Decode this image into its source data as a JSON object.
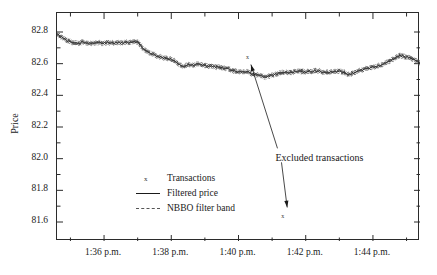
{
  "chart_data": {
    "type": "line",
    "title": "",
    "xlabel": "",
    "ylabel": "Price",
    "grid": false,
    "legend_position": "inside-lower-left",
    "ylim": [
      81.48,
      82.92
    ],
    "yticks": [
      "82.8",
      "82.6",
      "82.4",
      "82.2",
      "82.0",
      "81.8",
      "81.6"
    ],
    "ytick_values": [
      82.8,
      82.6,
      82.4,
      82.2,
      82.0,
      81.8,
      81.6
    ],
    "xticks": [
      "1:36 p.m.",
      "1:38 p.m.",
      "1:40 p.m.",
      "1:42 p.m.",
      "1:44 p.m."
    ],
    "xtick_minutes": [
      96,
      98,
      100,
      102,
      104
    ],
    "xlim_minutes": [
      94.6,
      105.4
    ],
    "series": [
      {
        "name": "Filtered price",
        "style": "solid",
        "color": "#333333",
        "x": [
          94.6,
          94.75,
          94.9,
          95.05,
          95.2,
          95.35,
          95.5,
          95.65,
          95.8,
          95.95,
          96.1,
          96.25,
          96.4,
          96.55,
          96.7,
          96.85,
          97.0,
          97.15,
          97.3,
          97.45,
          97.6,
          97.75,
          97.9,
          98.05,
          98.2,
          98.35,
          98.5,
          98.65,
          98.8,
          98.95,
          99.1,
          99.25,
          99.4,
          99.55,
          99.7,
          99.85,
          100.0,
          100.15,
          100.3,
          100.45,
          100.6,
          100.75,
          100.9,
          101.05,
          101.2,
          101.35,
          101.5,
          101.65,
          101.8,
          101.95,
          102.1,
          102.25,
          102.4,
          102.55,
          102.7,
          102.85,
          103.0,
          103.15,
          103.3,
          103.45,
          103.6,
          103.75,
          103.9,
          104.05,
          104.2,
          104.35,
          104.5,
          104.65,
          104.8,
          104.95,
          105.1,
          105.25,
          105.4
        ],
        "y": [
          82.785,
          82.765,
          82.745,
          82.735,
          82.73,
          82.735,
          82.73,
          82.728,
          82.732,
          82.73,
          82.734,
          82.73,
          82.735,
          82.733,
          82.736,
          82.734,
          82.738,
          82.7,
          82.675,
          82.66,
          82.645,
          82.64,
          82.632,
          82.625,
          82.6,
          82.585,
          82.595,
          82.59,
          82.6,
          82.592,
          82.585,
          82.58,
          82.578,
          82.572,
          82.565,
          82.555,
          82.548,
          82.552,
          82.545,
          82.535,
          82.525,
          82.515,
          82.52,
          82.53,
          82.54,
          82.545,
          82.542,
          82.548,
          82.552,
          82.548,
          82.552,
          82.556,
          82.552,
          82.548,
          82.545,
          82.548,
          82.552,
          82.545,
          82.53,
          82.545,
          82.558,
          82.565,
          82.572,
          82.58,
          82.592,
          82.6,
          82.615,
          82.635,
          82.652,
          82.645,
          82.638,
          82.62,
          82.605
        ]
      },
      {
        "name": "NBBO filter band",
        "style": "dashed",
        "color": "#7a7a7a",
        "band_half_width": 0.012
      }
    ],
    "markers": {
      "name": "Transactions",
      "symbol": "x",
      "color": "#3a3a3a"
    },
    "outliers": [
      {
        "label": "x",
        "minutes": 100.28,
        "price": 82.645
      },
      {
        "label": "x",
        "minutes": 101.33,
        "price": 81.635
      }
    ],
    "annotations": [
      {
        "text": "Excluded transactions",
        "points_to": [
          "outlier-upper",
          "outlier-lower"
        ]
      }
    ]
  },
  "legend": {
    "items": [
      {
        "key": "x",
        "label": "Transactions"
      },
      {
        "key": "solid-line",
        "label": "Filtered price"
      },
      {
        "key": "dashed-line",
        "label": "NBBO filter band"
      }
    ]
  },
  "axes": {
    "y_label": "Price",
    "y_ticks": [
      "82.8",
      "82.6",
      "82.4",
      "82.2",
      "82.0",
      "81.8",
      "81.6"
    ],
    "x_ticks": [
      "1:36 p.m.",
      "1:38 p.m.",
      "1:40 p.m.",
      "1:42 p.m.",
      "1:44 p.m."
    ]
  },
  "annotation": {
    "text": "Excluded transactions"
  },
  "outlier_markers": {
    "upper": "x",
    "lower": "x"
  },
  "colors": {
    "axis": "#2b2b2b",
    "line": "#333333",
    "band": "#7a7a7a",
    "text": "#1a1a1a",
    "background": "#ffffff"
  }
}
